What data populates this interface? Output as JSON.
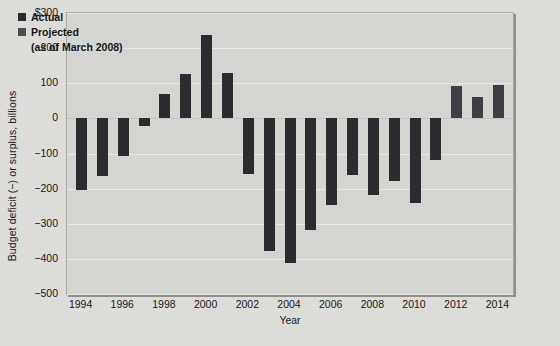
{
  "top_strip": {
    "ghost_text": "Fiscal year budget deficits and surpluses"
  },
  "chart_data": {
    "type": "bar",
    "title": "",
    "xlabel": "Year",
    "ylabel": "Budget deficit (−) or surplus, billions",
    "ylim": [
      -500,
      300
    ],
    "y_tick_values": [
      300,
      200,
      100,
      0,
      -100,
      -200,
      -300,
      -400,
      -500
    ],
    "y_tick_labels": [
      "$300",
      "200",
      "100",
      "0",
      "−100",
      "−200",
      "−300",
      "−400",
      "−500"
    ],
    "x_tick_labels": [
      "1994",
      "1996",
      "1998",
      "2000",
      "2002",
      "2004",
      "2006",
      "2008",
      "2010",
      "2012",
      "2014"
    ],
    "xlim": [
      1993.3,
      2014.7
    ],
    "grid": true,
    "legend_position": "upper-left",
    "categories": [
      1994,
      1995,
      1996,
      1997,
      1998,
      1999,
      2000,
      2001,
      2002,
      2003,
      2004,
      2005,
      2006,
      2007,
      2008,
      2009,
      2010,
      2011,
      2012,
      2013,
      2014
    ],
    "series": [
      {
        "name": "Actual",
        "color": "#2b2b30",
        "values": [
          -203,
          -164,
          -107,
          -22,
          69,
          126,
          236,
          128,
          -158,
          -378,
          -413,
          -318,
          -248,
          -162,
          -219,
          -178,
          -241,
          -118,
          null,
          null,
          null
        ]
      },
      {
        "name": "Projected (as of March 2008)",
        "color": "#3e3e44",
        "values": [
          null,
          null,
          null,
          null,
          null,
          null,
          null,
          null,
          null,
          null,
          null,
          null,
          null,
          null,
          null,
          null,
          null,
          null,
          91,
          62,
          96
        ]
      }
    ]
  },
  "legend": {
    "actual_label": "Actual",
    "projected_label": "Projected",
    "projected_sub": "(as of March 2008)"
  }
}
